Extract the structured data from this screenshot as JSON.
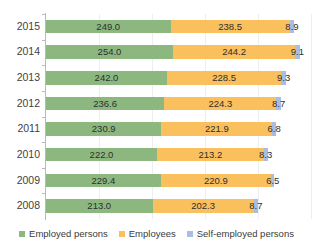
{
  "chart_data": {
    "type": "bar",
    "orientation": "horizontal",
    "title": "",
    "subtitle": "",
    "xlabel": "",
    "ylabel": "",
    "grid": true,
    "legend_position": "bottom",
    "categories": [
      "2015",
      "2014",
      "2013",
      "2012",
      "2011",
      "2010",
      "2009",
      "2008"
    ],
    "series": [
      {
        "name": "Employed persons",
        "color": "#8cb880",
        "values": [
          249.0,
          254.0,
          242.0,
          236.6,
          230.9,
          222.0,
          229.4,
          213.0
        ],
        "labels": [
          "249.0",
          "254.0",
          "242.0",
          "236.6",
          "230.9",
          "222.0",
          "229.4",
          "213.0"
        ]
      },
      {
        "name": "Employees",
        "color": "#fac05e",
        "values": [
          238.5,
          244.2,
          228.5,
          224.3,
          221.9,
          213.2,
          220.9,
          202.3
        ],
        "labels": [
          "238.5",
          "244.2",
          "228.5",
          "224.3",
          "221.9",
          "213.2",
          "220.9",
          "202.3"
        ]
      },
      {
        "name": "Self-employed persons",
        "color": "#a8bde0",
        "values": [
          8.9,
          9.1,
          9.3,
          8.7,
          6.8,
          8.3,
          6.5,
          8.7
        ],
        "labels": [
          "8.9",
          "9.1",
          "9.3",
          "8.7",
          "6.8",
          "8.3",
          "6.5",
          "8.7"
        ]
      }
    ],
    "xlim": [
      0,
      530
    ],
    "gridline_values": [
      106,
      212,
      318,
      424,
      530
    ]
  }
}
